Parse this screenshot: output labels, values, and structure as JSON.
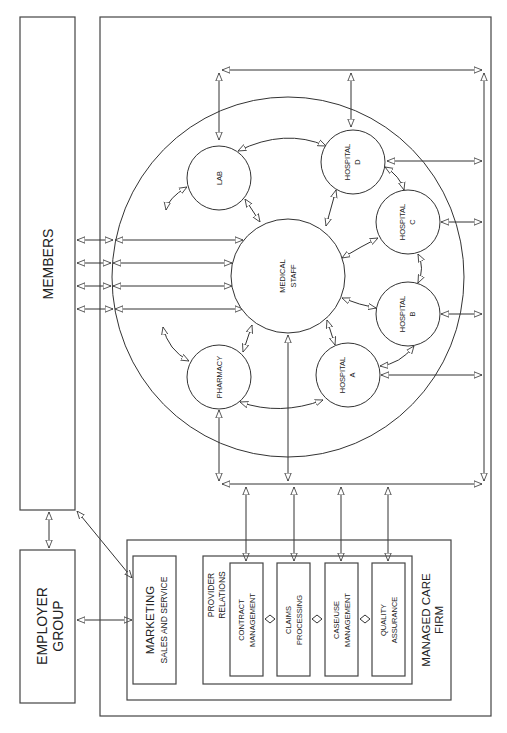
{
  "diagram": {
    "entities": {
      "members": "MEMBERS",
      "employer_group": [
        "EMPLOYER",
        "GROUP"
      ],
      "managed_care_firm": [
        "MANAGED CARE",
        "FIRM"
      ],
      "marketing": [
        "MARKETING",
        "SALES AND SERVICE"
      ],
      "provider_relations": [
        "PROVIDER",
        "RELATIONS"
      ],
      "departments": [
        [
          "CONTRACT",
          "MANAGEMENT"
        ],
        [
          "CLAIMS",
          "PROCESSING"
        ],
        [
          "CASE/USE",
          "MANAGEMENT"
        ],
        [
          "QUALITY",
          "ASSURANCE"
        ]
      ],
      "network_nodes": {
        "medical_staff": [
          "MEDICAL",
          "STAFF"
        ],
        "lab": "LAB",
        "pharmacy": "PHARMACY",
        "hospital_a": [
          "HOSPITAL",
          "A"
        ],
        "hospital_b": [
          "HOSPITAL",
          "B"
        ],
        "hospital_c": [
          "HOSPITAL",
          "C"
        ],
        "hospital_d": [
          "HOSPITAL",
          "D"
        ]
      }
    },
    "orientation": "rotated-90-ccw",
    "line_color": "#333333",
    "background": "#ffffff"
  }
}
